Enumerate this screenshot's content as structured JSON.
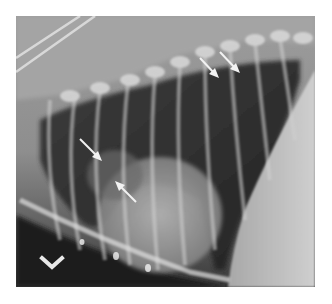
{
  "image": {
    "description": "Lateral thoracic radiograph (grayscale X-ray) with annotation arrows",
    "marker_label": "V",
    "annotations": [
      {
        "name": "arrow-dorsal-1",
        "tip": [
          217,
          76
        ],
        "tail": [
          200,
          58
        ]
      },
      {
        "name": "arrow-dorsal-2",
        "tip": [
          238,
          71
        ],
        "tail": [
          220,
          52
        ]
      },
      {
        "name": "arrow-hilar-1",
        "tip": [
          100,
          159
        ],
        "tail": [
          80,
          139
        ]
      },
      {
        "name": "arrow-hilar-2",
        "tip": [
          116,
          182
        ],
        "tail": [
          136,
          202
        ]
      }
    ],
    "colors": {
      "background": "#ffffff",
      "arrow": "#f2f2f2",
      "lung_dark": "#2a2a2a",
      "soft_tissue": "#b8b8b8"
    }
  }
}
